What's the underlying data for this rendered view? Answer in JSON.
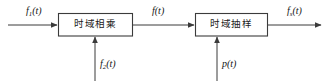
{
  "diagram": {
    "type": "block-diagram",
    "title": "",
    "background_color": "#ffffff",
    "line_color": "#3b3b3b",
    "text_color": "#141414",
    "blocks": [
      {
        "id": "block-1",
        "label": "时域相乘",
        "x": 58,
        "y": 13,
        "width": 75,
        "height": 23
      },
      {
        "id": "block-2",
        "label": "时域抽样",
        "x": 195,
        "y": 13,
        "width": 73,
        "height": 23
      }
    ],
    "signals": {
      "input": {
        "base": "f",
        "sub": "1",
        "arg": "(t)",
        "text": "f1(t)"
      },
      "middle": {
        "base": "f",
        "sub": "",
        "arg": "(t)",
        "text": "f(t)"
      },
      "output": {
        "base": "f",
        "sub": "s",
        "arg": "(t)",
        "text": "fs(t)"
      },
      "bottom_left": {
        "base": "f",
        "sub": "2",
        "arg": "(t)",
        "text": "f2(t)"
      },
      "bottom_right": {
        "base": "p",
        "sub": "",
        "arg": "(t)",
        "text": "p(t)"
      }
    }
  }
}
